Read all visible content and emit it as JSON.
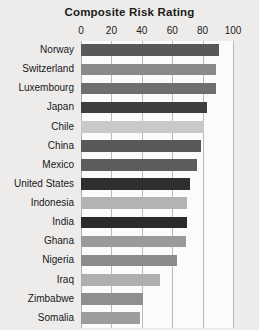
{
  "chart_data": {
    "type": "bar",
    "orientation": "horizontal",
    "title": "Composite Risk Rating",
    "xlabel": "",
    "ylabel": "",
    "xlim": [
      0,
      100
    ],
    "xticks": [
      0,
      20,
      40,
      60,
      80,
      100
    ],
    "xtick_labels": [
      "0",
      "20",
      "40",
      "60",
      "80",
      "100"
    ],
    "grid": true,
    "legend": false,
    "categories": [
      "Norway",
      "Switzerland",
      "Luxembourg",
      "Japan",
      "Chile",
      "China",
      "Mexico",
      "United States",
      "Indonesia",
      "India",
      "Ghana",
      "Nigeria",
      "Iraq",
      "Zimbabwe",
      "Somalia"
    ],
    "values": [
      91,
      89,
      89,
      83,
      81,
      79,
      76,
      72,
      70,
      70,
      69,
      63,
      52,
      41,
      39
    ],
    "bar_colors": [
      "#595959",
      "#8a8a8a",
      "#6e6e6e",
      "#3f3f3f",
      "#c9c9c9",
      "#585858",
      "#5d5d5d",
      "#2e2e2e",
      "#b3b3b3",
      "#2b2b2b",
      "#9a9a9a",
      "#8b8b8b",
      "#aeaeae",
      "#8f8f8f",
      "#9c9c9c"
    ],
    "background_color": "#edecea",
    "plot_background_color": "#fbfbfa",
    "gridline_color": "#b9b9b7"
  }
}
